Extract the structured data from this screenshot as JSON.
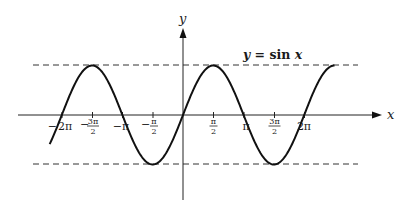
{
  "chart_data": {
    "type": "line",
    "title": "y = sin x",
    "xlabel": "x",
    "ylabel": "y",
    "function": "sin(x)",
    "x_range": [
      -2.2,
      2.5
    ],
    "x_range_units": "pi",
    "ylim": [
      -1,
      1
    ],
    "grid": false,
    "legend": null,
    "reference_lines": [
      {
        "y": 1,
        "style": "dashed"
      },
      {
        "y": -1,
        "style": "dashed"
      }
    ],
    "x_ticks": [
      {
        "value": "-2π",
        "label": "−2π"
      },
      {
        "value": "-3π/2",
        "label": "−3π/2"
      },
      {
        "value": "-π",
        "label": "−π"
      },
      {
        "value": "-π/2",
        "label": "−π/2"
      },
      {
        "value": "π/2",
        "label": "π/2"
      },
      {
        "value": "π",
        "label": "π"
      },
      {
        "value": "3π/2",
        "label": "3π/2"
      },
      {
        "value": "2π",
        "label": "2π"
      }
    ],
    "key_points": [
      {
        "x": "-2π",
        "y": 0
      },
      {
        "x": "-3π/2",
        "y": 1
      },
      {
        "x": "-π",
        "y": 0
      },
      {
        "x": "-π/2",
        "y": -1
      },
      {
        "x": "0",
        "y": 0
      },
      {
        "x": "π/2",
        "y": 1
      },
      {
        "x": "π",
        "y": 0
      },
      {
        "x": "3π/2",
        "y": -1
      },
      {
        "x": "2π",
        "y": 0
      },
      {
        "x": "5π/2",
        "y": 1
      }
    ]
  },
  "labels": {
    "axis_x": "x",
    "axis_y": "y",
    "curve": {
      "lhs": "y",
      "eq": " = sin ",
      "rhs": "x"
    },
    "ticks": {
      "neg_2pi": {
        "sign": "−",
        "num": "2π"
      },
      "neg_3pi_2": {
        "sign": "−",
        "num": "3π",
        "den": "2"
      },
      "neg_pi": {
        "sign": "−",
        "num": "π"
      },
      "neg_pi_2": {
        "sign": "−",
        "num": "π",
        "den": "2"
      },
      "pi_2": {
        "num": "π",
        "den": "2"
      },
      "pi": {
        "num": "π"
      },
      "3pi_2": {
        "num": "3π",
        "den": "2"
      },
      "2pi": {
        "num": "2π"
      }
    }
  }
}
